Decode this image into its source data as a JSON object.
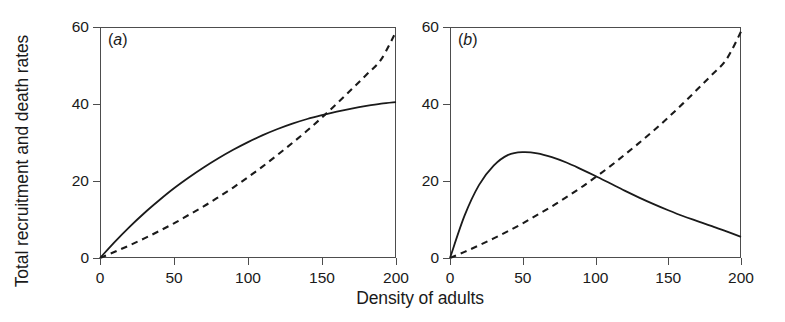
{
  "figure": {
    "xlabel": "Density of adults",
    "ylabel": "Total recruitment and death rates",
    "background_color": "#ffffff",
    "line_color": "#1a1a1a",
    "frame_color": "#4d4d4d"
  },
  "panels": [
    {
      "tag_open": "(",
      "tag_letter": "a",
      "tag_close": ")"
    },
    {
      "tag_open": "(",
      "tag_letter": "b",
      "tag_close": ")"
    }
  ],
  "axes": {
    "xticks": [
      "0",
      "50",
      "100",
      "150",
      "200"
    ],
    "yticks": [
      "60",
      "40",
      "20",
      "0"
    ]
  },
  "chart_data": {
    "type": "line",
    "title": "",
    "xlabel": "Density of adults",
    "ylabel": "Total recruitment and death rates",
    "xlim": [
      0,
      200
    ],
    "ylim": [
      0,
      60
    ],
    "xticks": [
      0,
      50,
      100,
      150,
      200
    ],
    "yticks": [
      0,
      20,
      40,
      60
    ],
    "grid": false,
    "legend": "none",
    "panels": [
      {
        "label": "(a)",
        "annotation": "Saturating (compensatory) recruitment crosses an accelerating death rate once, at about density 145, rate 35.",
        "series": [
          {
            "name": "Total recruitment rate",
            "style": "solid",
            "x": [
              0,
              10,
              20,
              30,
              40,
              50,
              60,
              70,
              80,
              90,
              100,
              110,
              120,
              130,
              140,
              150,
              160,
              170,
              180,
              190,
              200
            ],
            "values": [
              0.0,
              4.2,
              8.1,
              11.7,
              15.0,
              18.1,
              20.9,
              23.5,
              25.9,
              28.1,
              30.1,
              31.9,
              33.5,
              34.9,
              36.1,
              37.1,
              38.0,
              38.8,
              39.5,
              40.1,
              40.5
            ]
          },
          {
            "name": "Total death rate",
            "style": "dashed",
            "x": [
              0,
              10,
              20,
              30,
              40,
              50,
              60,
              70,
              80,
              90,
              100,
              110,
              120,
              130,
              140,
              150,
              160,
              170,
              180,
              190,
              200
            ],
            "values": [
              0.0,
              1.6,
              3.3,
              5.1,
              7.0,
              9.0,
              11.2,
              13.4,
              15.8,
              18.3,
              21.0,
              23.8,
              26.8,
              29.9,
              33.1,
              36.5,
              40.1,
              43.8,
              47.6,
              51.6,
              58.8
            ]
          }
        ],
        "crossings": [
          {
            "x": 145,
            "y": 35
          }
        ]
      },
      {
        "label": "(b)",
        "annotation": "Over-compensatory (humped) recruitment peaking near density 52 at rate 27.5, crossing the accelerating death rate at about density 102, rate 20.",
        "series": [
          {
            "name": "Total recruitment rate",
            "style": "solid",
            "x": [
              0,
              10,
              20,
              30,
              40,
              50,
              60,
              70,
              80,
              90,
              100,
              110,
              120,
              130,
              140,
              150,
              160,
              170,
              180,
              190,
              200
            ],
            "values": [
              0.0,
              11.0,
              19.0,
              24.0,
              26.8,
              27.5,
              27.2,
              26.2,
              24.8,
              23.1,
              21.3,
              19.4,
              17.5,
              15.7,
              14.0,
              12.4,
              10.9,
              9.6,
              8.3,
              6.9,
              5.5
            ]
          },
          {
            "name": "Total death rate",
            "style": "dashed",
            "x": [
              0,
              10,
              20,
              30,
              40,
              50,
              60,
              70,
              80,
              90,
              100,
              110,
              120,
              130,
              140,
              150,
              160,
              170,
              180,
              190,
              200
            ],
            "values": [
              0.0,
              1.6,
              3.3,
              5.1,
              7.0,
              9.0,
              11.2,
              13.4,
              15.8,
              18.3,
              21.0,
              23.8,
              26.8,
              29.9,
              33.1,
              36.5,
              40.1,
              43.8,
              47.6,
              51.6,
              58.8
            ]
          }
        ],
        "crossings": [
          {
            "x": 102,
            "y": 20
          }
        ]
      }
    ]
  }
}
